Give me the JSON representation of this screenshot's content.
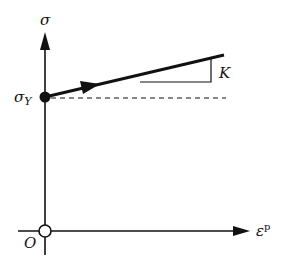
{
  "diagram": {
    "type": "stress-plastic-strain hardening curve",
    "y_axis": {
      "label": "σ"
    },
    "x_axis": {
      "label": "ε",
      "label_superscript": "p"
    },
    "origin_label": "O",
    "yield_label": "σ",
    "yield_subscript": "Y",
    "slope_label": "K",
    "colors": {
      "ink": "#111111",
      "background": "#ffffff"
    }
  }
}
